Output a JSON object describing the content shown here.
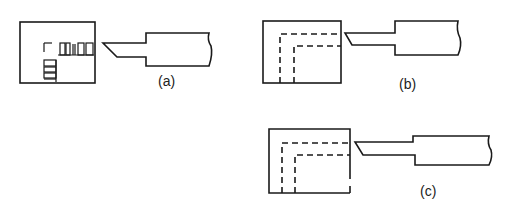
{
  "figure": {
    "panels": [
      {
        "id": "a",
        "label": "(a)",
        "description": "workpiece with machined (hatched) L-shaped cut region and cutting tool"
      },
      {
        "id": "b",
        "label": "(b)",
        "description": "workpiece with two dashed L-shaped tool paths and cutting tool"
      },
      {
        "id": "c",
        "label": "(c)",
        "description": "workpiece with two dashed L-shaped tool paths and cutting tool"
      }
    ],
    "colors": {
      "line": "#1a1a1a",
      "background": "#ffffff"
    }
  }
}
